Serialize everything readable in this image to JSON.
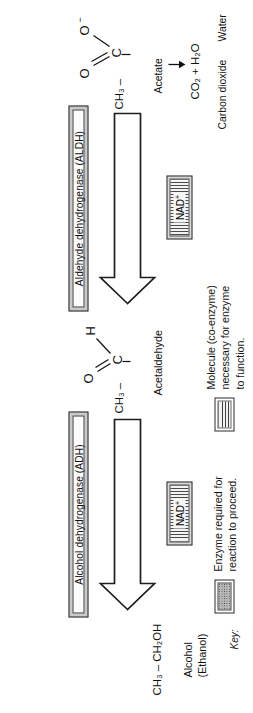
{
  "figure": {
    "type": "diagram",
    "orientation": "rotated-90-ccw"
  },
  "pathway": {
    "substrate": {
      "formula": "CH₃ – CH₂OH",
      "name_line1": "Alcohol",
      "name_line2": "(Ethanol)"
    },
    "intermediate": {
      "formula_prefix": "CH₃ –",
      "atoms": {
        "carbon": "C",
        "oxygen": "O",
        "hydrogen": "H"
      },
      "name": "Acetaldehyde"
    },
    "product": {
      "formula_prefix": "CH₃ –",
      "atoms": {
        "carbon": "C",
        "oxygen_double": "O",
        "oxygen_minus": "O⁻"
      },
      "name": "Acetate"
    },
    "final": {
      "formula": "CO₂ + H₂O",
      "label_left": "Carbon dioxide",
      "label_right": "Water"
    }
  },
  "enzymes": [
    {
      "id": "adh",
      "label": "Alcohol dehydrogenase (ADH)"
    },
    {
      "id": "aldh",
      "label": "Aldehyde dehydrogenase (ALDH)"
    }
  ],
  "coenzymes": [
    {
      "id": "nad-1",
      "label": "NAD",
      "charge": "+"
    },
    {
      "id": "nad-2",
      "label": "NAD",
      "charge": "+"
    }
  ],
  "key": {
    "title": "Key:",
    "entries": [
      {
        "swatch": "dotted",
        "text": "Enzyme required for\nreaction to proceed."
      },
      {
        "swatch": "striped",
        "text": "Molecule (co-enzyme)\nnecessary for enzyme\nto function."
      }
    ]
  },
  "colors": {
    "ink": "#1b1b1b",
    "bar_fill": "#c9c9c9",
    "stripe_dark": "#4a4a4a",
    "stripe_light": "#f2f2f2",
    "dot_fill": "#b9b9b9"
  }
}
